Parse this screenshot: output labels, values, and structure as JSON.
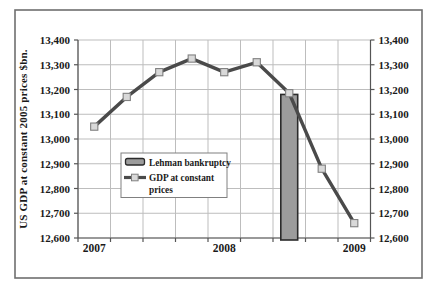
{
  "figure": {
    "background": "#ffffff",
    "border_color": "#6f6f6f"
  },
  "chart_data": {
    "type": "line",
    "title": "",
    "ylabel": "US GDP at constant 2005 prices $bn.",
    "categories": [
      "2007 Q1",
      "2007 Q2",
      "2007 Q3",
      "2007 Q4",
      "2008 Q1",
      "2008 Q2",
      "2008 Q3",
      "2008 Q4",
      "2009 Q1"
    ],
    "x_axis_labels": [
      {
        "text": "2007",
        "category_index": 0
      },
      {
        "text": "2008",
        "category_index": 4
      },
      {
        "text": "2009",
        "category_index": 8
      }
    ],
    "series": [
      {
        "name": "GDP at constant prices",
        "type": "line",
        "values": [
          13050,
          13170,
          13270,
          13325,
          13270,
          13310,
          13185,
          12880,
          12660
        ]
      },
      {
        "name": "Lehman bankruptcy",
        "type": "bar",
        "category_index": 6,
        "value": 13180
      }
    ],
    "ylim": [
      12600,
      13400
    ],
    "ytick_step": 100,
    "ytick_labels": [
      "13,400",
      "13,300",
      "13,200",
      "13,100",
      "13,000",
      "12,900",
      "12,800",
      "12,700",
      "12,600"
    ],
    "axes": {
      "y_left": true,
      "y_right": true,
      "grid": true,
      "legend_position": "inside-left-center"
    },
    "legend": {
      "items": [
        {
          "swatch": "bar",
          "label": "Lehman bankruptcy",
          "wrapped_lines": [
            "Lehman bankruptcy"
          ]
        },
        {
          "swatch": "line-marker",
          "label": "GDP at constant prices",
          "wrapped_lines": [
            "GDP at constant",
            "prices"
          ]
        }
      ]
    },
    "colors": {
      "line": "#4a4a4a",
      "marker_fill": "#d9d9d9",
      "marker_stroke": "#808080",
      "bar_fill": "#9c9c9c",
      "bar_stroke": "#2b2b2b",
      "grid": "#bdbdbd",
      "axis": "#555555",
      "text": "#1a1a1a",
      "legend_border": "#808080"
    }
  }
}
